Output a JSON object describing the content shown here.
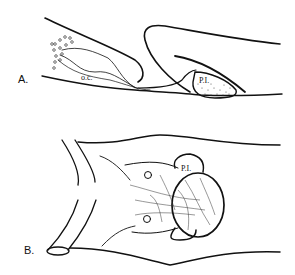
{
  "figure": {
    "panels": [
      {
        "id": "A",
        "label": "A.",
        "view": "sagittal section",
        "annotations": [
          "o.c.",
          "P.I."
        ]
      },
      {
        "id": "B",
        "label": "B.",
        "view": "ventral view",
        "annotations": [
          "P.I."
        ]
      }
    ]
  }
}
